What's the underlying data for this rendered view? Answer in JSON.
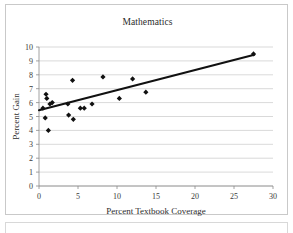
{
  "chart_data": {
    "type": "scatter",
    "title": "Mathematics",
    "xlabel": "Percent Textbook Coverage",
    "ylabel": "Percent Gain",
    "xlim": [
      0,
      30
    ],
    "ylim": [
      0,
      10
    ],
    "xticks": [
      0,
      5,
      10,
      15,
      20,
      25,
      30
    ],
    "yticks": [
      0,
      1,
      2,
      3,
      4,
      5,
      6,
      7,
      8,
      9,
      10
    ],
    "xtick_labels": [
      "0",
      "5",
      "10",
      "15",
      "20",
      "25",
      "30"
    ],
    "ytick_labels": [
      "0",
      "1",
      "2",
      "3",
      "4",
      "5",
      "6",
      "7",
      "8",
      "9",
      "10"
    ],
    "grid": "horizontal",
    "legend": "none",
    "marker": "diamond",
    "marker_color": "#111111",
    "series": [
      {
        "name": "Schools",
        "points": [
          [
            0.5,
            5.6
          ],
          [
            0.8,
            4.9
          ],
          [
            0.9,
            6.6
          ],
          [
            1.0,
            6.3
          ],
          [
            1.2,
            4.0
          ],
          [
            1.4,
            5.9
          ],
          [
            1.7,
            6.0
          ],
          [
            3.7,
            5.9
          ],
          [
            3.8,
            5.1
          ],
          [
            4.3,
            7.6
          ],
          [
            4.4,
            4.8
          ],
          [
            5.3,
            5.6
          ],
          [
            5.8,
            5.6
          ],
          [
            6.8,
            5.9
          ],
          [
            8.2,
            7.85
          ],
          [
            10.3,
            6.3
          ],
          [
            12.0,
            7.7
          ],
          [
            13.7,
            6.75
          ],
          [
            27.5,
            9.5
          ]
        ]
      }
    ],
    "trendline": {
      "name": "linear-fit",
      "x_start": 0.0,
      "y_start": 5.45,
      "x_end": 27.6,
      "y_end": 9.45,
      "color": "#111111"
    }
  }
}
